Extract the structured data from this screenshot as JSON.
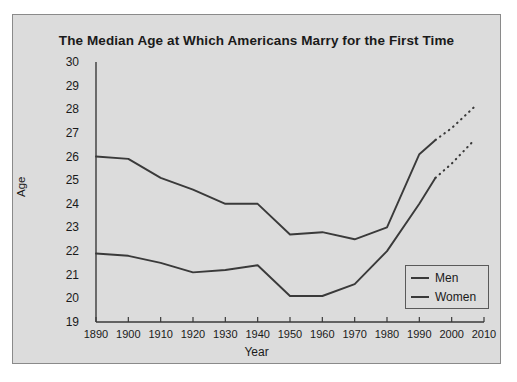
{
  "chart_data": {
    "type": "line",
    "title": "The Median Age at Which Americans Marry for the First Time",
    "xlabel": "Year",
    "ylabel": "Age",
    "x": [
      1890,
      1900,
      1910,
      1920,
      1930,
      1940,
      1950,
      1960,
      1970,
      1980,
      1990,
      1995,
      2000,
      2010
    ],
    "xticklabels": [
      "1890",
      "1900",
      "1910",
      "1920",
      "1930",
      "1940",
      "1950",
      "1960",
      "1970",
      "1980",
      "1990",
      "2000",
      "2010"
    ],
    "xticks": [
      1890,
      1900,
      1910,
      1920,
      1930,
      1940,
      1950,
      1960,
      1970,
      1980,
      1990,
      2000,
      2010
    ],
    "yticks": [
      19,
      20,
      21,
      22,
      23,
      24,
      25,
      26,
      27,
      28,
      29,
      30
    ],
    "yticklabels": [
      "19",
      "20",
      "21",
      "22",
      "23",
      "24",
      "25",
      "26",
      "27",
      "28",
      "29",
      "30"
    ],
    "xlim": [
      1890,
      2010
    ],
    "ylim": [
      19,
      30
    ],
    "grid": false,
    "legend_position": "lower right",
    "series": [
      {
        "name": "Men",
        "color": "#3a3a3a",
        "solid": {
          "x": [
            1890,
            1900,
            1910,
            1920,
            1930,
            1940,
            1950,
            1960,
            1970,
            1980,
            1990,
            1995
          ],
          "values": [
            26.0,
            25.9,
            25.1,
            24.6,
            24.0,
            24.0,
            22.7,
            22.8,
            22.5,
            23.0,
            26.1,
            26.7
          ]
        },
        "projection": {
          "x": [
            1995,
            2000,
            2007
          ],
          "values": [
            26.7,
            27.2,
            28.1
          ],
          "style": "dotted"
        }
      },
      {
        "name": "Women",
        "color": "#3a3a3a",
        "solid": {
          "x": [
            1890,
            1900,
            1910,
            1920,
            1930,
            1940,
            1950,
            1960,
            1970,
            1980,
            1990,
            1995
          ],
          "values": [
            21.9,
            21.8,
            21.5,
            21.1,
            21.2,
            21.4,
            20.1,
            20.1,
            20.6,
            22.0,
            24.0,
            25.1
          ]
        },
        "projection": {
          "x": [
            1995,
            2000,
            2007
          ],
          "values": [
            25.1,
            25.7,
            26.7
          ],
          "style": "dotted"
        }
      }
    ]
  },
  "legend": {
    "items": [
      {
        "label": "Men"
      },
      {
        "label": "Women"
      }
    ]
  },
  "colors": {
    "line": "#3a3a3a",
    "panel_background": "#dcdcdc",
    "panel_border": "#8a8a8a",
    "text": "#1a1a1a",
    "page_background": "#ffffff"
  }
}
